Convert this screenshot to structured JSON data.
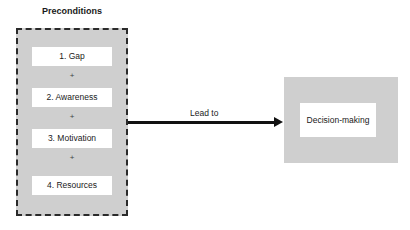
{
  "diagram": {
    "preconditions": {
      "title": "Preconditions",
      "items": [
        {
          "label": "1. Gap"
        },
        {
          "label": "2. Awareness"
        },
        {
          "label": "3. Motivation"
        },
        {
          "label": "4. Resources"
        }
      ],
      "separator": "+"
    },
    "connector": {
      "label": "Lead to"
    },
    "outcome": {
      "label": "Decision-making"
    },
    "colors": {
      "box_fill": "#cfcfcf",
      "inner_fill": "#ffffff",
      "line": "#111111"
    }
  }
}
